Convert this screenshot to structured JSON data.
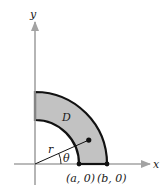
{
  "figure": {
    "axes": {
      "x_label": "x",
      "y_label": "y",
      "axis_color": "#a3a3a3"
    },
    "region": {
      "label": "D",
      "fill_color": "#c2c2c2",
      "stroke_color": "#111111",
      "description": "Quarter annulus in first quadrant between radii a and b"
    },
    "points": {
      "a_label": "(a, 0)",
      "b_label": "(b, 0)"
    },
    "polar": {
      "r_label": "r",
      "theta_label": "θ",
      "theta_degrees": 24,
      "r_fraction": 0.53
    }
  }
}
